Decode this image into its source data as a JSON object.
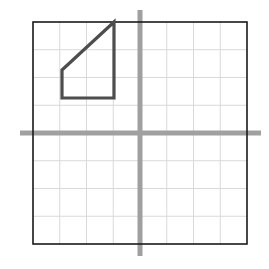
{
  "figure": {
    "title": "",
    "background_color": "#ffffff",
    "width": 269,
    "height": 269
  },
  "grid": {
    "label": "coordinate-grid",
    "columns": 8,
    "rows": 8,
    "cell_size_px": 26.75,
    "left_px": 33,
    "top_px": 22,
    "right_px": 247,
    "bottom_px": 244,
    "inner_line_color": "#d9d9d9",
    "inner_line_width": 1,
    "border_color": "#1a1a1a",
    "border_width": 1.6
  },
  "axes": {
    "label": "coordinate-axes",
    "color": "#a0a0a0",
    "line_width": 5,
    "x_axis": {
      "name": "x-axis",
      "y_px": 133,
      "start_px": 20,
      "end_px": 261,
      "grid_row_index": 4
    },
    "y_axis": {
      "name": "y-axis",
      "x_px": 140,
      "start_px": 10,
      "end_px": 256,
      "grid_column_index": 4
    },
    "origin_px": {
      "x": 140,
      "y": 133
    }
  },
  "shape": {
    "name": "right-trapezoid",
    "stroke_color": "#4d4d4d",
    "stroke_width": 3.2,
    "fill": "none",
    "vertices_px": [
      {
        "x": 62,
        "y": 98
      },
      {
        "x": 62,
        "y": 70
      },
      {
        "x": 114,
        "y": 22
      },
      {
        "x": 114,
        "y": 98
      }
    ],
    "vertices_grid": [
      {
        "x": -3,
        "y": 1
      },
      {
        "x": -3,
        "y": 2
      },
      {
        "x": -1,
        "y": 4
      },
      {
        "x": -1,
        "y": 1
      }
    ],
    "quadrant": "second",
    "closed": true
  },
  "chart_data": {
    "type": "scatter",
    "title": "",
    "xlabel": "",
    "ylabel": "",
    "xlim": [
      -4,
      4
    ],
    "ylim": [
      -4,
      4
    ],
    "x_ticks": [
      -4,
      -3,
      -2,
      -1,
      0,
      1,
      2,
      3,
      4
    ],
    "y_ticks": [
      -4,
      -3,
      -2,
      -1,
      0,
      1,
      2,
      3,
      4
    ],
    "grid": true,
    "legend": false,
    "series": [
      {
        "name": "right-trapezoid",
        "kind": "polygon",
        "closed": true,
        "x": [
          -3,
          -3,
          -1,
          -1
        ],
        "y": [
          1,
          2,
          4,
          1
        ]
      }
    ],
    "annotations": []
  }
}
